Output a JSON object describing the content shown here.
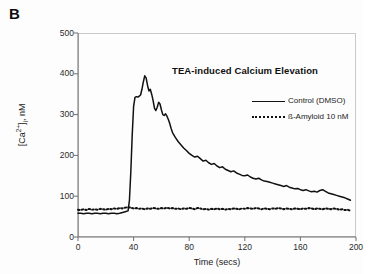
{
  "panel": {
    "label": "B"
  },
  "chart_data": {
    "type": "line",
    "title": "TEA-induced Calcium Elevation",
    "xlabel": "Time (secs)",
    "ylabel": "[Ca2+]i, nM",
    "ylabel_parts": {
      "prefix": "[Ca",
      "sup": "2+",
      "close": "]",
      "sub": "i",
      "suffix": ", nM"
    },
    "xlim": [
      0,
      200
    ],
    "ylim": [
      0,
      500
    ],
    "xticks": [
      0,
      40,
      80,
      120,
      160,
      200
    ],
    "yticks": [
      0,
      100,
      200,
      300,
      400,
      500
    ],
    "grid": false,
    "legend_position": "inside-right",
    "series": [
      {
        "name": "Control (DMSO)",
        "style": "solid",
        "color": "#111111",
        "x": [
          0,
          2,
          4,
          6,
          8,
          10,
          12,
          14,
          16,
          18,
          20,
          22,
          24,
          26,
          28,
          30,
          32,
          34,
          36,
          37,
          38,
          39,
          40,
          41,
          42,
          43,
          44,
          45,
          46,
          47,
          48,
          49,
          50,
          51,
          52,
          53,
          54,
          55,
          56,
          57,
          58,
          59,
          60,
          61,
          62,
          63,
          64,
          65,
          66,
          67,
          68,
          70,
          72,
          74,
          76,
          78,
          80,
          82,
          84,
          86,
          88,
          90,
          92,
          94,
          96,
          98,
          100,
          102,
          104,
          106,
          108,
          110,
          112,
          114,
          116,
          118,
          120,
          122,
          124,
          126,
          128,
          130,
          132,
          134,
          136,
          138,
          140,
          142,
          144,
          146,
          148,
          150,
          152,
          154,
          156,
          158,
          160,
          162,
          164,
          166,
          168,
          170,
          172,
          174,
          176,
          178,
          180,
          182,
          184,
          186,
          188,
          190,
          192,
          194,
          196
        ],
        "y": [
          58,
          58,
          57,
          58,
          58,
          57,
          58,
          58,
          57,
          58,
          58,
          57,
          58,
          58,
          57,
          58,
          60,
          62,
          64,
          90,
          160,
          250,
          320,
          342,
          344,
          343,
          345,
          348,
          362,
          380,
          395,
          390,
          372,
          358,
          362,
          350,
          335,
          316,
          310,
          318,
          330,
          326,
          312,
          300,
          298,
          302,
          296,
          288,
          278,
          266,
          256,
          244,
          234,
          226,
          218,
          212,
          205,
          200,
          196,
          198,
          192,
          186,
          188,
          182,
          178,
          180,
          174,
          170,
          172,
          166,
          163,
          160,
          162,
          157,
          154,
          151,
          150,
          152,
          147,
          144,
          142,
          144,
          140,
          137,
          136,
          134,
          132,
          130,
          128,
          126,
          124,
          126,
          122,
          120,
          118,
          119,
          116,
          114,
          116,
          113,
          111,
          112,
          110,
          114,
          116,
          112,
          108,
          106,
          104,
          102,
          100,
          98,
          96,
          93,
          90
        ]
      },
      {
        "name": "ß-Amyloid 10 nM",
        "style": "dotted",
        "color": "#111111",
        "x": [
          0,
          2,
          4,
          6,
          8,
          10,
          12,
          14,
          16,
          18,
          20,
          22,
          24,
          26,
          28,
          30,
          32,
          34,
          36,
          38,
          40,
          42,
          44,
          46,
          48,
          50,
          52,
          54,
          56,
          58,
          60,
          62,
          64,
          66,
          68,
          70,
          72,
          74,
          76,
          78,
          80,
          82,
          84,
          86,
          88,
          90,
          92,
          94,
          96,
          98,
          100,
          102,
          104,
          106,
          108,
          110,
          112,
          114,
          116,
          118,
          120,
          122,
          124,
          126,
          128,
          130,
          132,
          134,
          136,
          138,
          140,
          142,
          144,
          146,
          148,
          150,
          152,
          154,
          156,
          158,
          160,
          162,
          164,
          166,
          168,
          170,
          172,
          174,
          176,
          178,
          180,
          182,
          184,
          186,
          188,
          190,
          192,
          194,
          196
        ],
        "y": [
          67,
          66,
          68,
          66,
          69,
          67,
          68,
          67,
          69,
          68,
          67,
          69,
          68,
          70,
          69,
          71,
          70,
          72,
          73,
          72,
          70,
          71,
          69,
          70,
          68,
          70,
          69,
          71,
          70,
          69,
          71,
          70,
          72,
          70,
          71,
          69,
          70,
          68,
          70,
          69,
          71,
          70,
          68,
          71,
          70,
          68,
          69,
          67,
          69,
          68,
          70,
          68,
          69,
          67,
          69,
          68,
          70,
          69,
          68,
          70,
          69,
          71,
          70,
          69,
          71,
          70,
          68,
          70,
          69,
          68,
          70,
          69,
          71,
          70,
          68,
          70,
          69,
          68,
          70,
          69,
          68,
          70,
          69,
          71,
          70,
          68,
          70,
          69,
          68,
          70,
          69,
          68,
          70,
          69,
          67,
          68,
          66,
          67,
          64
        ]
      }
    ]
  },
  "legend": {
    "items": [
      {
        "label": "Control (DMSO)",
        "style": "solid"
      },
      {
        "label": "ß-Amyloid 10 nM",
        "style": "dotted"
      }
    ]
  }
}
